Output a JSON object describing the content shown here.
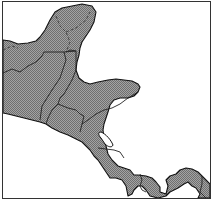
{
  "map": {
    "region": "Central America",
    "style": "hatched gray land on white background, black outline",
    "colors": {
      "land": "#9a9a9a",
      "hatch": "#6f6f6f",
      "outline": "#111111",
      "water": "#ffffff",
      "frame": "#333333"
    },
    "countries": [
      {
        "name": "Mexico (Yucatán portion)"
      },
      {
        "name": "Belize"
      },
      {
        "name": "Guatemala"
      },
      {
        "name": "Honduras"
      },
      {
        "name": "El Salvador"
      },
      {
        "name": "Nicaragua"
      },
      {
        "name": "Costa Rica"
      },
      {
        "name": "Panama"
      },
      {
        "name": "Colombia (edge)"
      }
    ],
    "features": [
      {
        "name": "Lake Nicaragua"
      }
    ]
  }
}
